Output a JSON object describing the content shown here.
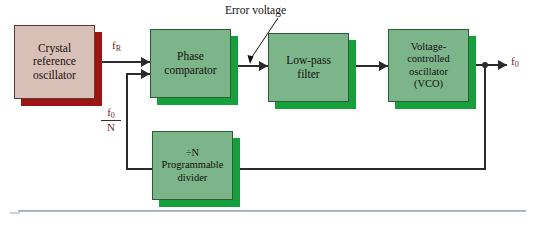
{
  "diagram": {
    "blocks": {
      "crystal": {
        "line1": "Crystal",
        "line2": "reference",
        "line3": "oscillator",
        "color": "#d9c0b6",
        "shadow": "#9c1414"
      },
      "phase_comparator": {
        "line1": "Phase",
        "line2": "comparator",
        "color": "#7cb58a",
        "shadow": "#16a03c"
      },
      "low_pass_filter": {
        "line1": "Low-pass",
        "line2": "filter",
        "color": "#7cb58a",
        "shadow": "#16a03c"
      },
      "vco": {
        "line1": "Voltage-",
        "line2": "controlled",
        "line3": "oscillator",
        "line4": "(VCO)",
        "color": "#7cb58a",
        "shadow": "#16a03c"
      },
      "divider": {
        "line1": "÷N",
        "line2": "Programmable",
        "line3": "divider",
        "color": "#7cb58a",
        "shadow": "#16a03c"
      }
    },
    "signals": {
      "reference_frequency": "f",
      "reference_frequency_sub": "R",
      "output_frequency": "f",
      "output_frequency_sub": "0",
      "feedback_numerator": "f",
      "feedback_numerator_sub": "0",
      "feedback_denominator": "N",
      "signal_color": "#6b2b20"
    },
    "annotations": {
      "error_voltage": "Error voltage"
    },
    "wire_color": "#2b2b2b",
    "rule_color": "#93a7c4"
  }
}
